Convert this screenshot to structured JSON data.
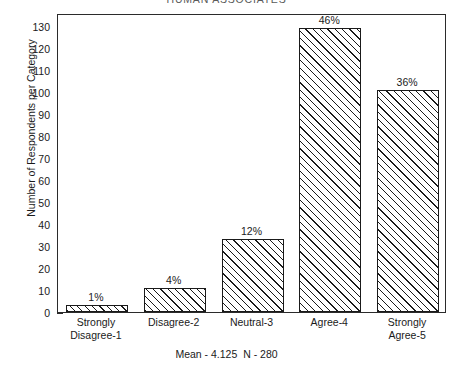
{
  "chart_data": {
    "type": "bar",
    "title": "HUMAN ASSOCIATES",
    "categories": [
      "Strongly\nDisagree-1",
      "Disagree-2",
      "Neutral-3",
      "Agree-4",
      "Strongly\nAgree-5"
    ],
    "values": [
      3,
      11,
      33,
      129,
      101
    ],
    "data_labels": [
      "1%",
      "4%",
      "12%",
      "46%",
      "36%"
    ],
    "xlabel": "",
    "ylabel": "Number of Respondents per Category",
    "ylim": [
      0,
      136
    ],
    "ytick_labels": [
      "0",
      "10",
      "20",
      "30",
      "40",
      "50",
      "60",
      "70",
      "80",
      "90",
      "100",
      "110",
      "120",
      "130"
    ],
    "ytick_values": [
      0,
      10,
      20,
      30,
      40,
      50,
      60,
      70,
      80,
      90,
      100,
      110,
      120,
      130
    ],
    "grid": false,
    "legend": null,
    "caption": "Mean - 4.125  N - 280",
    "mean": "4.125",
    "n": "280",
    "bar_style": "diagonal-hatch",
    "colors": {
      "bar_outline": "#1a1a1a",
      "bar_fill": "#ffffff",
      "hatch": "#1a1a1a",
      "axis": "#2b2b2b",
      "text": "#1a1a1a",
      "background": "#ffffff"
    }
  }
}
